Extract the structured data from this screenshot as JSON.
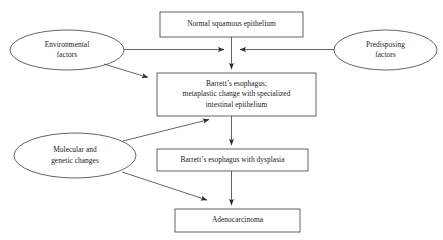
{
  "diagram": {
    "type": "flowchart",
    "stroke_color": "#3d3d3d",
    "text_color": "#1a1a1a",
    "background_color": "#ffffff",
    "nodes": [
      {
        "id": "normal-squamous-epithelium",
        "shape": "rectangle",
        "lines": [
          "Normal squamous epithelium"
        ],
        "x": 160,
        "y": 12,
        "w": 143,
        "h": 25
      },
      {
        "id": "environmental-factors",
        "shape": "ellipse",
        "lines": [
          "Environmental",
          "factors"
        ],
        "x": 10,
        "y": 30,
        "w": 114,
        "h": 40
      },
      {
        "id": "predisposing-factors",
        "shape": "ellipse",
        "lines": [
          "Predisposing",
          "factors"
        ],
        "x": 334,
        "y": 30,
        "w": 103,
        "h": 40
      },
      {
        "id": "barretts-esophagus-metaplasia",
        "shape": "rectangle",
        "lines": [
          "Barrett’s esophagus;",
          "metaplastic change with specialized",
          "intestinal epithelium"
        ],
        "x": 157,
        "y": 73,
        "w": 159,
        "h": 43
      },
      {
        "id": "molecular-genetic-changes",
        "shape": "ellipse",
        "lines": [
          "Molecular and",
          "genetic changes"
        ],
        "x": 14,
        "y": 133,
        "w": 122,
        "h": 45
      },
      {
        "id": "barretts-esophagus-dysplasia",
        "shape": "rectangle",
        "lines": [
          "Barrett’s esophagus with dysplasia"
        ],
        "x": 157,
        "y": 149,
        "w": 151,
        "h": 22
      },
      {
        "id": "adenocarcinoma",
        "shape": "rectangle",
        "lines": [
          "Adenocarcinoma"
        ],
        "x": 175,
        "y": 209,
        "w": 125,
        "h": 23
      }
    ],
    "edges": [
      {
        "id": "normal-to-metaplasia",
        "from": "normal-squamous-epithelium",
        "to": "barretts-esophagus-metaplasia",
        "kind": "vertical-arrow"
      },
      {
        "id": "environmental-to-trunk",
        "from": "environmental-factors",
        "to": "normal-squamous-epithelium",
        "kind": "horizontal-arrow-right"
      },
      {
        "id": "predisposing-to-trunk",
        "from": "predisposing-factors",
        "to": "normal-squamous-epithelium",
        "kind": "horizontal-arrow-left"
      },
      {
        "id": "environmental-to-metaplasia",
        "from": "environmental-factors",
        "to": "barretts-esophagus-metaplasia",
        "kind": "diagonal-arrow"
      },
      {
        "id": "molecular-to-metaplasia",
        "from": "molecular-genetic-changes",
        "to": "barretts-esophagus-metaplasia",
        "kind": "diagonal-arrow"
      },
      {
        "id": "metaplasia-to-dysplasia",
        "from": "barretts-esophagus-metaplasia",
        "to": "barretts-esophagus-dysplasia",
        "kind": "vertical-arrow"
      },
      {
        "id": "molecular-to-adenocarcinoma",
        "from": "molecular-genetic-changes",
        "to": "adenocarcinoma",
        "kind": "diagonal-arrow"
      },
      {
        "id": "dysplasia-to-adenocarcinoma",
        "from": "barretts-esophagus-dysplasia",
        "to": "adenocarcinoma",
        "kind": "vertical-arrow"
      }
    ]
  }
}
